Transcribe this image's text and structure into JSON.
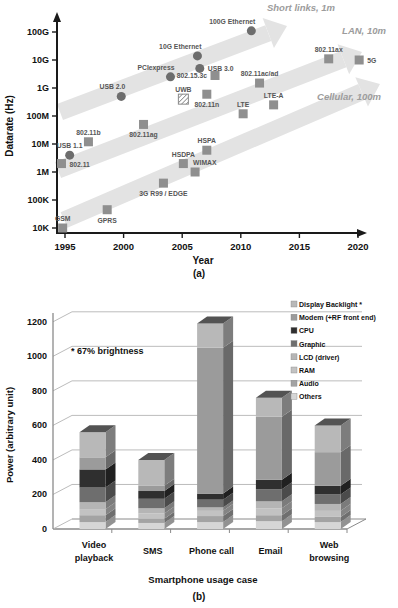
{
  "figure": {
    "caption_a": "(a)",
    "caption_b": "(b)"
  },
  "chart_data": [
    {
      "type": "scatter",
      "title": "Datarate evolution of wired and wireless links",
      "xlabel": "Year",
      "ylabel": "Datarate (Hz)",
      "x_ticks": [
        1995,
        2000,
        2005,
        2010,
        2015,
        2020
      ],
      "y_ticks": [
        "10K",
        "100K",
        "1M",
        "10M",
        "100M",
        "1G",
        "10G",
        "100G"
      ],
      "y_log_exponent_range": [
        4,
        11
      ],
      "xlim": [
        1994,
        2021
      ],
      "grid": false,
      "marker_colors": {
        "circle": "#6d6d6d",
        "square": "#8f8f8f",
        "hatched": "#8a8a8a"
      },
      "band_color": "#e3e3e3",
      "bands": [
        {
          "label": "Short links, 1m",
          "x1": 60,
          "y1": 112,
          "x2": 287,
          "y2": 26,
          "label_dx": 14,
          "label_dy": -15
        },
        {
          "label": "LAN, 10m",
          "x1": 58,
          "y1": 170,
          "x2": 362,
          "y2": 52,
          "label_dx": 2,
          "label_dy": -18
        },
        {
          "label": "Cellular, 100m",
          "x1": 64,
          "y1": 220,
          "x2": 380,
          "y2": 84,
          "label_dx": -31,
          "label_dy": 16
        }
      ],
      "points": [
        {
          "label": "GSM",
          "year": 1994.8,
          "hz": 10000,
          "marker": "square",
          "lp": "a"
        },
        {
          "label": "GPRS",
          "year": 1998.6,
          "hz": 45000,
          "marker": "square",
          "lp": "b"
        },
        {
          "label": "3G R99 / EDGE",
          "year": 2003.4,
          "hz": 400000,
          "marker": "square",
          "lp": "b"
        },
        {
          "label": "802.11",
          "year": 1994.7,
          "hz": 2000000,
          "marker": "square",
          "lp": "r"
        },
        {
          "label": "USB 1.1",
          "year": 1995.4,
          "hz": 4000000,
          "marker": "circle",
          "lp": "a"
        },
        {
          "label": "802.11b",
          "year": 1997.0,
          "hz": 12000000,
          "marker": "square",
          "lp": "a"
        },
        {
          "label": "802.11ag",
          "year": 2001.7,
          "hz": 50000000,
          "marker": "square",
          "lp": "b"
        },
        {
          "label": "HSDPA",
          "year": 2005.1,
          "hz": 2000000,
          "marker": "square",
          "lp": "a"
        },
        {
          "label": "WIMAX",
          "year": 2006.1,
          "hz": 1000000,
          "marker": "square",
          "lp": "ar"
        },
        {
          "label": "HSPA",
          "year": 2007.1,
          "hz": 6000000,
          "marker": "square",
          "lp": "a"
        },
        {
          "label": "USB 2.0",
          "year": 1999.8,
          "hz": 500000000,
          "marker": "circle",
          "lp": "al"
        },
        {
          "label": "PCIexpress",
          "year": 2004.0,
          "hz": 2500000000,
          "marker": "circle",
          "lp": "al"
        },
        {
          "label": "UWB",
          "year": 2005.1,
          "hz": 400000000,
          "marker": "hatched",
          "lp": "a"
        },
        {
          "label": "802.11n",
          "year": 2007.1,
          "hz": 600000000,
          "marker": "square",
          "lp": "b"
        },
        {
          "label": "10G Ethernet",
          "year": 2006.3,
          "hz": 14000000000,
          "marker": "circle",
          "lp": "al"
        },
        {
          "label": "USB 3.0",
          "year": 2006.5,
          "hz": 5000000000,
          "marker": "circle",
          "lp": "r"
        },
        {
          "label": "802.15.3c",
          "year": 2007.8,
          "hz": 2800000000,
          "marker": "square",
          "lp": "l"
        },
        {
          "label": "100G Ethernet",
          "year": 2010.9,
          "hz": 110000000000,
          "marker": "circle",
          "lp": "al"
        },
        {
          "label": "LTE",
          "year": 2010.2,
          "hz": 120000000,
          "marker": "square",
          "lp": "a"
        },
        {
          "label": "802.11ac/ad",
          "year": 2011.6,
          "hz": 1500000000,
          "marker": "square",
          "lp": "a"
        },
        {
          "label": "LTE-A",
          "year": 2012.8,
          "hz": 250000000,
          "marker": "square",
          "lp": "a"
        },
        {
          "label": "802.11ax",
          "year": 2017.5,
          "hz": 11000000000,
          "marker": "square",
          "lp": "a"
        },
        {
          "label": "5G",
          "year": 2020.1,
          "hz": 10000000000,
          "marker": "square",
          "lp": "r"
        }
      ]
    },
    {
      "type": "bar",
      "stacked": true,
      "three_d": true,
      "title": "Smartphone power breakdown per usage case",
      "xlabel": "Smartphone usage case",
      "ylabel": "Power (arbitrary unit)",
      "ylim": [
        0,
        1200
      ],
      "y_ticks": [
        0,
        200,
        400,
        600,
        800,
        1000,
        1200
      ],
      "annotation": "* 67% brightness",
      "legend_position": "top-right",
      "categories": [
        "Video playback",
        "SMS",
        "Phone call",
        "Email",
        "Web browsing"
      ],
      "category_lines": [
        [
          "Video",
          "playback"
        ],
        [
          "SMS"
        ],
        [
          "Phone call"
        ],
        [
          "Email"
        ],
        [
          "Web",
          "browsing"
        ]
      ],
      "stack_order_bottom_to_top": [
        "Others",
        "Audio",
        "RAM",
        "LCD (driver)",
        "Graphic",
        "CPU",
        "Modem (+RF front end)",
        "Display Backlight"
      ],
      "series": [
        {
          "name": "Display Backlight",
          "footnote": "*",
          "color": "#b8b8b8",
          "values": [
            145,
            150,
            140,
            110,
            155
          ]
        },
        {
          "name": "Modem (+RF front end)",
          "color": "#9b9b9b",
          "values": [
            70,
            30,
            845,
            365,
            195
          ]
        },
        {
          "name": "CPU",
          "color": "#2f2f2f",
          "values": [
            105,
            45,
            35,
            55,
            50
          ]
        },
        {
          "name": "Graphic",
          "color": "#6e6e6e",
          "values": [
            85,
            55,
            45,
            70,
            55
          ]
        },
        {
          "name": "LCD (driver)",
          "color": "#b5b5b5",
          "values": [
            40,
            30,
            20,
            40,
            40
          ]
        },
        {
          "name": "RAM",
          "color": "#c2c2c2",
          "values": [
            35,
            30,
            30,
            40,
            35
          ]
        },
        {
          "name": "Audio",
          "color": "#a3a3a3",
          "values": [
            40,
            25,
            35,
            35,
            30
          ]
        },
        {
          "name": "Others",
          "color": "#d6d6d6",
          "values": [
            40,
            35,
            40,
            45,
            40
          ]
        }
      ],
      "totals": [
        560,
        400,
        1190,
        760,
        600
      ]
    }
  ]
}
